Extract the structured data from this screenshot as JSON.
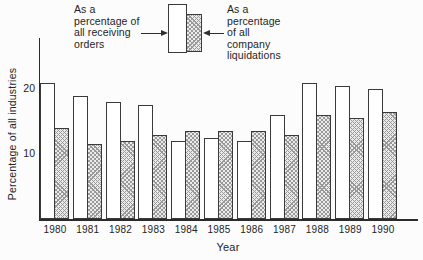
{
  "legend": {
    "left_label": "As a\npercentage of\nall receiving\norders",
    "right_label": "As a\npercentage\nof all\ncompany\nliquidations"
  },
  "chart_data": {
    "type": "bar",
    "title": "",
    "xlabel": "Year",
    "ylabel": "Percentage of all industries",
    "categories": [
      "1980",
      "1981",
      "1982",
      "1983",
      "1984",
      "1985",
      "1986",
      "1987",
      "1988",
      "1989",
      "1990"
    ],
    "series": [
      {
        "name": "As a percentage of all receiving orders",
        "style": "plain-white",
        "values": [
          21,
          19,
          18,
          17.5,
          12,
          12.5,
          12,
          16,
          21,
          20.5,
          20
        ]
      },
      {
        "name": "As a percentage of all company liquidations",
        "style": "crosshatch",
        "values": [
          14,
          11.5,
          12,
          13,
          13.5,
          13.5,
          13.5,
          13,
          16,
          15.5,
          16.5
        ]
      }
    ],
    "y_ticks": [
      10,
      20
    ],
    "ylim": [
      0,
      23
    ],
    "grid": false,
    "legend_position": "top-center"
  },
  "colors": {
    "ink": "#2b2b2b",
    "bar_plain_fill": "#ffffff",
    "bar_hatch_fill": "#ebebeb",
    "bar_hatch_line": "#999999",
    "background": "#fcfcfc"
  }
}
